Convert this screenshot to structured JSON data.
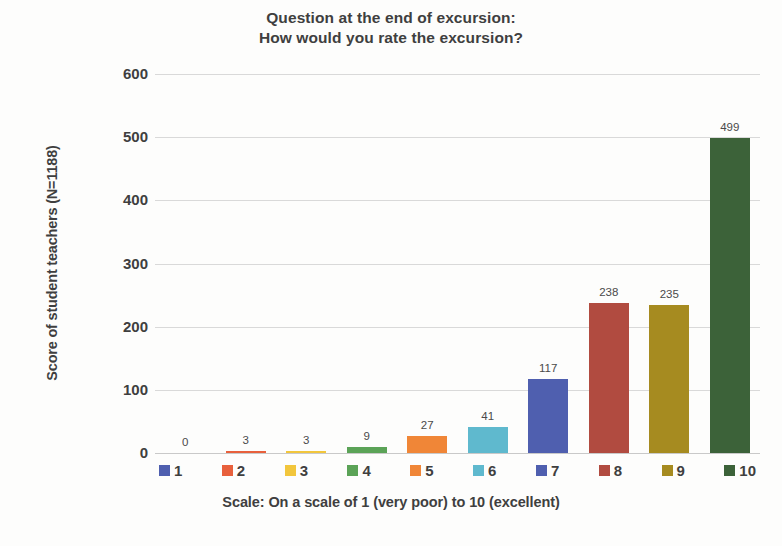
{
  "chart_data": {
    "type": "bar",
    "title": "Question at the end of excursion:\nHow would you rate the excursion?",
    "title_line1": "Question at the end of excursion:",
    "title_line2": "How would you rate the excursion?",
    "xlabel": "Scale: On a scale of 1 (very poor) to 10 (excellent)",
    "ylabel": "Score of student teachers (N=1188)",
    "categories": [
      "1",
      "2",
      "3",
      "4",
      "5",
      "6",
      "7",
      "8",
      "9",
      "10"
    ],
    "values": [
      0,
      3,
      3,
      9,
      27,
      41,
      117,
      238,
      235,
      499
    ],
    "value_labels": [
      "0",
      "3",
      "3",
      "9",
      "27",
      "41",
      "117",
      "238",
      "235",
      "499"
    ],
    "colors": [
      "#4F5FAF",
      "#E8603C",
      "#F2C63C",
      "#5BA357",
      "#F08637",
      "#5FB9CE",
      "#4F5FAF",
      "#B14B40",
      "#A68B20",
      "#3C6239"
    ],
    "ylim": [
      0,
      600
    ],
    "yticks": [
      600,
      500,
      400,
      300,
      200,
      100,
      0
    ],
    "ytick_labels": [
      "600",
      "500",
      "400",
      "300",
      "200",
      "100",
      "0"
    ],
    "grid": true,
    "legend_position": "bottom",
    "legend": [
      {
        "label": "1",
        "color": "#4F5FAF"
      },
      {
        "label": "2",
        "color": "#E8603C"
      },
      {
        "label": "3",
        "color": "#F2C63C"
      },
      {
        "label": "4",
        "color": "#5BA357"
      },
      {
        "label": "5",
        "color": "#F08637"
      },
      {
        "label": "6",
        "color": "#5FB9CE"
      },
      {
        "label": "7",
        "color": "#4F5FAF"
      },
      {
        "label": "8",
        "color": "#B14B40"
      },
      {
        "label": "9",
        "color": "#A68B20"
      },
      {
        "label": "10",
        "color": "#3C6239"
      }
    ]
  }
}
